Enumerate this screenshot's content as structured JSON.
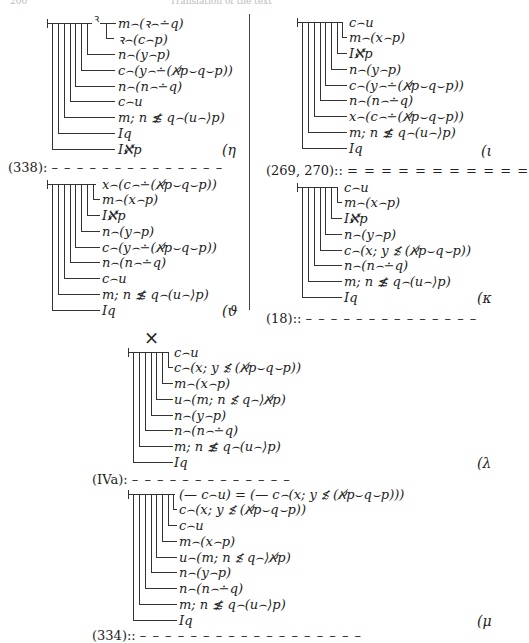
{
  "header": {
    "page_number": "200",
    "running_title": "Translation of the text"
  },
  "blocks": [
    {
      "id": "eta",
      "tag": "(η",
      "rows": [
        "m⌢(ꝛ⌢∸q)",
        "ꝛ⌢(c⌢p)",
        "n⌢(y⌢p)",
        "c⌢(y⌢∸(ℵ̸p⌣q⌣p))",
        "n⌢(n⌢∸q)",
        "c⌢u",
        "m; n ≴ q⌢(u⌢⟩p)",
        "Iq",
        "Iℵ̸p"
      ],
      "concavity_var": "ꝛ"
    },
    {
      "id": "theta",
      "tag": "(ϑ",
      "rows": [
        "x⌢(c⌢∸(ℵ̸p⌣q⌣p))",
        "m⌢(x⌢p)",
        "Iℵ̸p",
        "n⌢(y⌢p)",
        "c⌢(y⌢∸(ℵ̸p⌣q⌣p))",
        "n⌢(n⌢∸q)",
        "c⌢u",
        "m; n ≴ q⌢(u⌢⟩p)",
        "Iq"
      ]
    },
    {
      "id": "iota",
      "tag": "(ι",
      "rows": [
        "c⌢u",
        "m⌢(x⌢p)",
        "Iℵ̸p",
        "n⌢(y⌢p)",
        "c⌢(y⌢∸(ℵ̸p⌣q⌣p))",
        "n⌢(n⌢∸q)",
        "x⌢(c⌢∸(ℵ̸p⌣q⌣p))",
        "m; n ≴ q⌢(u⌢⟩p)",
        "Iq"
      ]
    },
    {
      "id": "kappa",
      "tag": "(κ",
      "rows": [
        "c⌢u",
        "m⌢(x⌢p)",
        "Iℵ̸p",
        "n⌢(y⌢p)",
        "c⌢(x; y ≴ (ℵ̸p⌣q⌣p))",
        "n⌢(n⌢∸q)",
        "m; n ≴ q⌢(u⌢⟩p)",
        "Iq"
      ]
    },
    {
      "id": "lambda",
      "tag": "(λ",
      "rows": [
        "c⌢u",
        "c⌢(x; y ≴ (ℵ̸p⌣q⌣p))",
        "m⌢(x⌢p)",
        "u⌢(m; n ≴ q⌢⟩ℵ̸p)",
        "n⌢(y⌢p)",
        "n⌢(n⌢∸q)",
        "m; n ≴ q⌢(u⌢⟩p)",
        "Iq"
      ]
    },
    {
      "id": "mu",
      "tag": "(μ",
      "rows": [
        "(— c⌢u) = (— c⌢(x; y ≴ (ℵ̸p⌣q⌣p)))",
        "c⌢(x; y ≴ (ℵ̸p⌣q⌣p))",
        "c⌢u",
        "m⌢(x⌢p)",
        "u⌢(m; n ≴ q⌢⟩ℵ̸p)",
        "n⌢(y⌢p)",
        "n⌢(n⌢∸q)",
        "m; n ≴ q⌢(u⌢⟩p)",
        "Iq"
      ]
    }
  ],
  "separators": [
    {
      "label": "(338):",
      "style": "dashed"
    },
    {
      "label": "(269, 270)::",
      "style": "double"
    },
    {
      "label": "(18)::",
      "style": "dashed"
    },
    {
      "label": "(IVa):",
      "style": "dashed"
    },
    {
      "label": "(334)::",
      "style": "dashed"
    }
  ],
  "symbols": {
    "times": "×"
  }
}
